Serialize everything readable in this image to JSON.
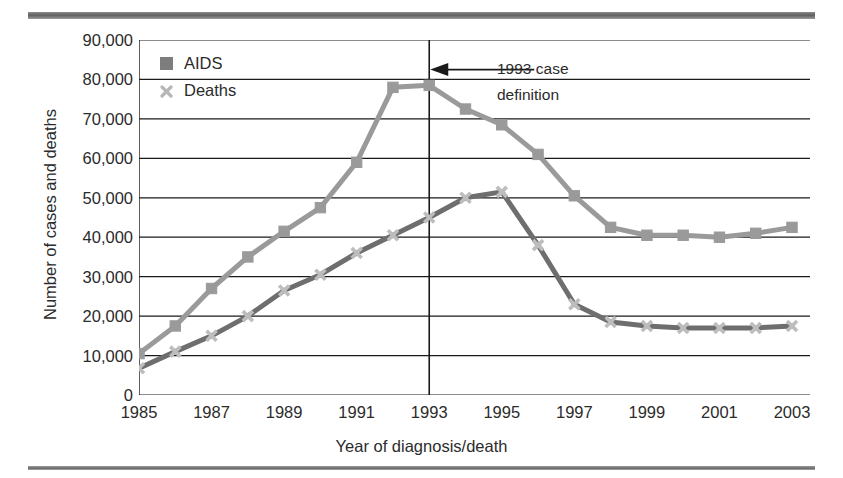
{
  "figure": {
    "clipped_caption_fragment": "",
    "rule_color": "#6f6f6f"
  },
  "legend": {
    "position": "inside-top-left",
    "items": [
      {
        "label": "AIDS",
        "marker": "square-marker",
        "color": "#7d7d7d"
      },
      {
        "label": "Deaths",
        "marker": "cross-marker",
        "color": "#b7b7b7"
      }
    ]
  },
  "annotation": {
    "line1": "1993 case",
    "line2": "definition",
    "arrow_icon": "left-arrow-icon",
    "at_year": 1993
  },
  "chart_data": {
    "type": "line",
    "title": "",
    "xlabel": "Year of diagnosis/death",
    "ylabel": "Number of cases and deaths",
    "xlim": [
      1985,
      2003
    ],
    "ylim": [
      0,
      90000
    ],
    "ytick_labels": [
      "90,000",
      "80,000",
      "70,000",
      "60,000",
      "50,000",
      "40,000",
      "30,000",
      "20,000",
      "10,000",
      "0"
    ],
    "ytick_values": [
      90000,
      80000,
      70000,
      60000,
      50000,
      40000,
      30000,
      20000,
      10000,
      0
    ],
    "xtick_labels": [
      "1985",
      "1987",
      "1989",
      "1991",
      "1993",
      "1995",
      "1997",
      "1999",
      "2001",
      "2003"
    ],
    "xtick_values": [
      1985,
      1987,
      1989,
      1991,
      1993,
      1995,
      1997,
      1999,
      2001,
      2003
    ],
    "x": [
      1985,
      1986,
      1987,
      1988,
      1989,
      1990,
      1991,
      1992,
      1993,
      1994,
      1995,
      1996,
      1997,
      1998,
      1999,
      2000,
      2001,
      2002,
      2003
    ],
    "grid": "horizontal",
    "legend_position": "inside-top-left",
    "annotations": [
      {
        "text": "1993 case definition",
        "x": 1993,
        "type": "vertical-line-with-arrow"
      }
    ],
    "series": [
      {
        "name": "AIDS",
        "color": "#9a9a9a",
        "marker": "square",
        "values": [
          10500,
          17500,
          27000,
          35000,
          41500,
          47500,
          59000,
          78000,
          78500,
          72500,
          68500,
          61000,
          50500,
          42500,
          40500,
          40500,
          40000,
          41000,
          42500
        ]
      },
      {
        "name": "Deaths",
        "color": "#6e6e6e",
        "marker": "cross",
        "values": [
          6800,
          11000,
          15000,
          20000,
          26500,
          30500,
          36000,
          40500,
          45000,
          50000,
          51500,
          38000,
          23000,
          18500,
          17500,
          17000,
          17000,
          17000,
          17500
        ]
      }
    ]
  }
}
